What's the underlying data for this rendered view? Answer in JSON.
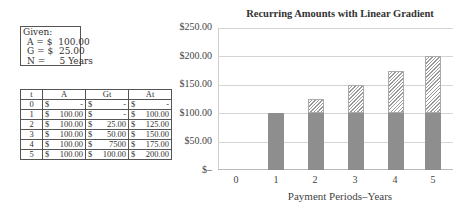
{
  "given": {
    "title": "Given:",
    "rows": [
      "A = $  100.00",
      "G = $  25.00",
      "N =     5 Years"
    ]
  },
  "table": {
    "headers": [
      "t",
      "A",
      "Gt",
      "At"
    ],
    "rows": [
      [
        "0",
        "$",
        "-",
        "$",
        "-",
        "$",
        "-"
      ],
      [
        "1",
        "$",
        "100.00",
        "$",
        "-",
        "$",
        "100.00"
      ],
      [
        "2",
        "$",
        "100.00",
        "$",
        "25.00",
        "$",
        "125.00"
      ],
      [
        "3",
        "$",
        "100.00",
        "$",
        "50.00",
        "$",
        "150.00"
      ],
      [
        "4",
        "$",
        "100.00",
        "$",
        "7500",
        "$",
        "175.00"
      ],
      [
        "5",
        "$",
        "100.00",
        "$",
        "100.00",
        "$",
        "200.00"
      ]
    ]
  },
  "chart_data": {
    "type": "bar",
    "stacked": true,
    "title": "Recurring Amounts with Linear Gradient",
    "xlabel": "Payment Periods–Years",
    "ylabel": "",
    "categories": [
      "0",
      "1",
      "2",
      "3",
      "4",
      "5"
    ],
    "series": [
      {
        "name": "A (uniform)",
        "values": [
          0,
          100,
          100,
          100,
          100,
          100
        ],
        "fill": "#8e8e8e"
      },
      {
        "name": "Gt (gradient)",
        "values": [
          0,
          0,
          25,
          50,
          75,
          100
        ],
        "fill": "hatched"
      }
    ],
    "ytick_labels": [
      "$–",
      "$50.00",
      "$100.00",
      "$150.00",
      "$200.00",
      "$250.00"
    ],
    "ylim": [
      0,
      250
    ],
    "grid": true,
    "legend": "none"
  }
}
